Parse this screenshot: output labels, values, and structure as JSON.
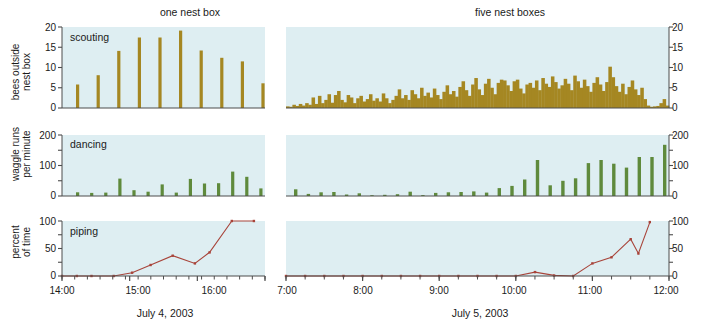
{
  "figure": {
    "panel_titles": [
      "one nest box",
      "five nest boxes"
    ],
    "captions": [
      "July 4, 2003",
      "July 5, 2003"
    ],
    "colors": {
      "panel_background": "#deeef2",
      "scouting_bar": "#a58722",
      "dancing_bar": "#5f8a3c",
      "piping_line": "#a8443a",
      "axis": "#4d4d4d",
      "text": "#1a1a1a"
    }
  },
  "chart_data": [
    {
      "type": "bar",
      "title": "one nest box",
      "panel_label": "scouting",
      "ylabel": "bees outside nest box",
      "xlabel": "July 4, 2003",
      "ylim": [
        0,
        20
      ],
      "yticks": [
        0,
        5,
        10,
        15,
        20
      ],
      "ytick_labels": [
        "0",
        "5",
        "10",
        "15",
        "20"
      ],
      "xlim": [
        "14:00",
        "16:40"
      ],
      "xticks": [
        "14:00",
        "15:00",
        "16:00"
      ],
      "xtick_labels": [
        "14:00",
        "15:00",
        "16:00"
      ],
      "xminor_count": 16,
      "grid": false,
      "x": [
        14.2,
        14.4,
        14.6,
        14.85,
        15.1,
        15.35,
        15.6,
        15.85,
        16.1,
        16.4
      ],
      "values": [
        5.8,
        8.1,
        14.1,
        17.4,
        17.4,
        19.1,
        14.2,
        12.4,
        11.5,
        6.1
      ]
    },
    {
      "type": "bar",
      "title": "five nest boxes",
      "panel_label": "",
      "ylabel": "bees outside nest box",
      "xlabel": "July 5, 2003",
      "ylim": [
        0,
        20
      ],
      "yticks": [
        0,
        5,
        10,
        15,
        20
      ],
      "ytick_labels": [
        "0",
        "5",
        "10",
        "15",
        "20"
      ],
      "xlim": [
        "7:00",
        "12:00"
      ],
      "xticks": [
        "7:00",
        "8:00",
        "9:00",
        "10:00",
        "11:00",
        "12:00"
      ],
      "xtick_labels": [
        "7:00",
        "8:00",
        "9:00",
        "10:00",
        "11:00",
        "12:00"
      ],
      "grid": false,
      "values": [
        0.4,
        0.3,
        0.8,
        0.5,
        1.0,
        0.6,
        1.2,
        0.8,
        2.6,
        1.0,
        3.0,
        1.2,
        2.0,
        3.4,
        1.3,
        3.2,
        4.2,
        2.0,
        1.4,
        3.2,
        2.6,
        1.2,
        2.4,
        3.0,
        1.6,
        2.2,
        3.4,
        1.8,
        2.4,
        1.6,
        3.6,
        2.4,
        1.2,
        2.0,
        3.0,
        4.6,
        2.4,
        3.2,
        2.0,
        4.4,
        3.4,
        2.4,
        5.0,
        3.0,
        3.8,
        2.6,
        4.8,
        3.2,
        2.2,
        4.0,
        5.6,
        3.4,
        4.2,
        2.8,
        5.2,
        6.6,
        4.4,
        3.0,
        5.8,
        7.4,
        4.6,
        3.2,
        6.0,
        7.2,
        5.0,
        3.4,
        6.2,
        7.0,
        6.8,
        5.6,
        4.2,
        6.6,
        7.0,
        4.8,
        3.6,
        5.8,
        6.2,
        5.0,
        6.8,
        4.4,
        7.4,
        6.0,
        5.2,
        7.8,
        6.4,
        4.8,
        5.6,
        7.2,
        6.0,
        4.4,
        8.0,
        6.6,
        5.0,
        7.0,
        5.4,
        4.0,
        6.2,
        7.6,
        5.8,
        4.2,
        6.4,
        10.2,
        7.6,
        5.4,
        4.0,
        6.0,
        3.4,
        5.2,
        6.8,
        4.6,
        3.2,
        5.0,
        2.2,
        0.6,
        0.3,
        0.4,
        0.5,
        1.2,
        2.2,
        0.6
      ]
    },
    {
      "type": "bar",
      "title": "one nest box",
      "panel_label": "dancing",
      "ylabel": "waggle runs per minute",
      "xlabel": "July 4, 2003",
      "ylim": [
        0,
        200
      ],
      "yticks": [
        0,
        100,
        200
      ],
      "ytick_labels": [
        "0",
        "100",
        "200"
      ],
      "xlim": [
        "14:00",
        "16:40"
      ],
      "grid": false,
      "x": [
        14.2,
        14.4,
        14.6,
        14.85,
        15.1,
        15.3,
        15.5,
        15.7,
        15.9,
        16.05,
        16.2,
        16.35,
        16.5,
        16.65
      ],
      "values": [
        12,
        10,
        11,
        57,
        19,
        14,
        38,
        11,
        56,
        41,
        42,
        80,
        63,
        25
      ]
    },
    {
      "type": "bar",
      "title": "five nest boxes",
      "panel_label": "",
      "ylabel": "waggle runs per minute",
      "xlabel": "July 5, 2003",
      "ylim": [
        0,
        200
      ],
      "yticks": [
        0,
        100,
        200
      ],
      "ytick_labels": [
        "0",
        "100",
        "200"
      ],
      "xlim": [
        "7:00",
        "12:00"
      ],
      "grid": false,
      "values": [
        22,
        7,
        12,
        13,
        5,
        9,
        2,
        4,
        6,
        14,
        3,
        10,
        12,
        13,
        15,
        11,
        26,
        33,
        54,
        118,
        35,
        50,
        58,
        108,
        118,
        106,
        93,
        128,
        128,
        168
      ]
    },
    {
      "type": "line",
      "title": "one nest box",
      "panel_label": "piping",
      "ylabel": "percent of time",
      "xlabel": "July 4, 2003",
      "ylim": [
        0,
        100
      ],
      "yticks": [
        0,
        50,
        100
      ],
      "ytick_labels": [
        "0",
        "50",
        "100"
      ],
      "xlim": [
        "14:00",
        "16:40"
      ],
      "xticks": [
        "14:00",
        "15:00",
        "16:00"
      ],
      "grid": false,
      "x": [
        14.0,
        14.2,
        14.4,
        14.7,
        14.95,
        15.2,
        15.5,
        15.8,
        16.0,
        16.3,
        16.6
      ],
      "values": [
        0,
        0,
        0,
        0,
        6,
        20,
        37,
        23,
        43,
        100,
        100
      ]
    },
    {
      "type": "line",
      "title": "five nest boxes",
      "panel_label": "",
      "ylabel": "percent of time",
      "xlabel": "July 5, 2003",
      "ylim": [
        0,
        100
      ],
      "yticks": [
        0,
        50,
        100
      ],
      "ytick_labels": [
        "0",
        "50",
        "100"
      ],
      "xlim": [
        "7:00",
        "12:00"
      ],
      "xticks": [
        "7:00",
        "8:00",
        "9:00",
        "10:00",
        "11:00",
        "12:00"
      ],
      "grid": false,
      "x": [
        7.0,
        7.25,
        7.5,
        7.75,
        8.0,
        8.25,
        8.5,
        8.75,
        9.0,
        9.25,
        9.5,
        9.75,
        10.0,
        10.25,
        10.5,
        10.75,
        11.0,
        11.25,
        11.5,
        11.6,
        11.75
      ],
      "values": [
        0,
        0,
        0,
        0,
        0,
        0,
        0,
        0,
        0,
        0,
        0,
        0,
        0,
        7,
        1,
        0,
        23,
        34,
        67,
        41,
        98
      ]
    }
  ]
}
